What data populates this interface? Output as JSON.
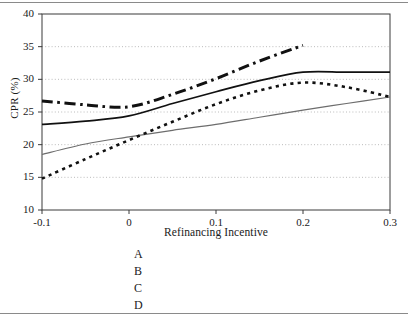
{
  "chart_data": {
    "type": "line",
    "title": "",
    "xlabel": "Refinancing Incentive",
    "ylabel": "CPR (%)",
    "xlim": [
      -0.1,
      0.3
    ],
    "ylim": [
      10,
      40
    ],
    "xticks": [
      "-0.1",
      "0",
      "0.1",
      "0.2",
      "0.3"
    ],
    "xtick_values": [
      -0.1,
      0,
      0.1,
      0.2,
      0.3
    ],
    "yticks": [
      "10",
      "15",
      "20",
      "25",
      "30",
      "35",
      "40"
    ],
    "ytick_values": [
      10,
      15,
      20,
      25,
      30,
      35,
      40
    ],
    "grid": "horizontal-dotted",
    "legend_position": "below-left",
    "series": [
      {
        "name": "A",
        "style": "solid-thin-gray",
        "color": "#6d6d6d",
        "x": [
          -0.1,
          -0.05,
          0.0,
          0.05,
          0.1,
          0.15,
          0.2,
          0.25,
          0.3
        ],
        "values": [
          18.5,
          20.1,
          21.2,
          22.2,
          23.1,
          24.2,
          25.3,
          26.3,
          27.3
        ]
      },
      {
        "name": "B",
        "style": "dotted-thick-black",
        "color": "#111111",
        "x": [
          -0.1,
          -0.05,
          0.0,
          0.05,
          0.1,
          0.15,
          0.2,
          0.25,
          0.3
        ],
        "values": [
          14.8,
          17.8,
          20.7,
          23.5,
          26.2,
          28.3,
          29.5,
          28.8,
          27.3
        ]
      },
      {
        "name": "C",
        "style": "solid-black",
        "color": "#111111",
        "x": [
          -0.1,
          -0.05,
          0.0,
          0.05,
          0.1,
          0.15,
          0.2,
          0.25,
          0.3
        ],
        "values": [
          23.1,
          23.6,
          24.4,
          26.3,
          28.1,
          29.8,
          31.1,
          31.1,
          31.1
        ]
      },
      {
        "name": "D",
        "style": "dashdot-thick-black",
        "color": "#111111",
        "x": [
          -0.1,
          -0.05,
          0.0,
          0.05,
          0.1,
          0.15,
          0.2
        ],
        "values": [
          26.7,
          26.1,
          25.8,
          27.7,
          30.1,
          32.8,
          35.2
        ]
      }
    ]
  },
  "legend": {
    "items": [
      {
        "label": "A"
      },
      {
        "label": "B"
      },
      {
        "label": "C"
      },
      {
        "label": "D"
      }
    ]
  },
  "colors": {
    "axis": "#3a3a3a",
    "grid": "#b4b4b4",
    "series_a": "#6d6d6d",
    "series_black": "#111111",
    "rule": "#8a8a8a"
  }
}
